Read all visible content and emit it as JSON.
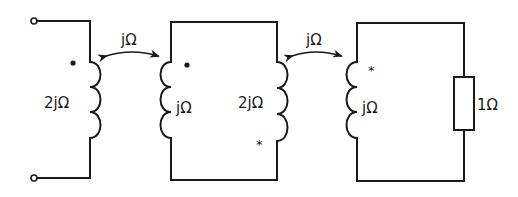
{
  "diagram": {
    "type": "coupled-inductor-circuit",
    "mutual_couplings": [
      {
        "label": "jΩ",
        "between": [
          "L1",
          "L2"
        ]
      },
      {
        "label": "jΩ",
        "between": [
          "L3",
          "L4"
        ]
      }
    ],
    "inductors": [
      {
        "id": "L1",
        "label": "2jΩ",
        "polarity_mark": "•"
      },
      {
        "id": "L2",
        "label": "jΩ",
        "polarity_mark": "•"
      },
      {
        "id": "L3",
        "label": "2jΩ",
        "polarity_mark": "*"
      },
      {
        "id": "L4",
        "label": "jΩ",
        "polarity_mark": "*"
      }
    ],
    "resistor": {
      "id": "R1",
      "label": "1Ω"
    },
    "terminals": [
      "input-top",
      "input-bottom"
    ]
  },
  "colors": {
    "stroke": "#1a1a1a",
    "background": "#ffffff"
  }
}
